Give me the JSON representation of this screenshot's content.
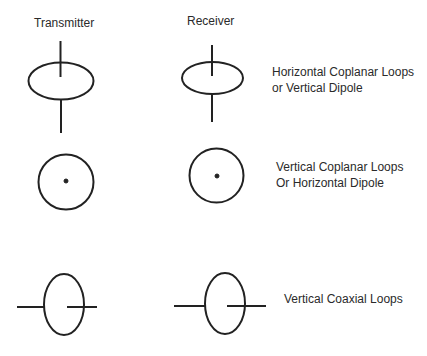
{
  "headers": {
    "transmitter": "Transmitter",
    "receiver": "Receiver"
  },
  "rows": [
    {
      "id": "horizontal-coplanar",
      "label_lines": [
        "Horizontal Coplanar Loops",
        "or  Vertical Dipole"
      ],
      "symbol": "horizontal-loop-with-vertical-axis"
    },
    {
      "id": "vertical-coplanar",
      "label_lines": [
        "Vertical Coplanar Loops",
        "Or  Horizontal Dipole"
      ],
      "symbol": "circle-with-center-dot"
    },
    {
      "id": "vertical-coaxial",
      "label_lines": [
        "Vertical Coaxial Loops"
      ],
      "symbol": "vertical-loop-with-horizontal-axis"
    }
  ],
  "colors": {
    "stroke": "#222222",
    "text": "#2a2a2a",
    "background": "#ffffff"
  }
}
